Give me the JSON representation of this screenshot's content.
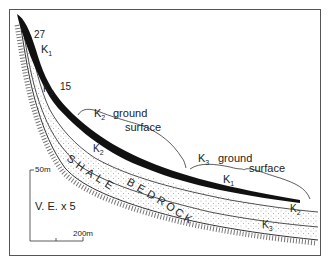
{
  "diagram": {
    "labels": {
      "k1_top": "K",
      "k1_top_sub": "1",
      "k3_left": "K",
      "k3_left_sub": "3",
      "slope_27": "27",
      "slope_15": "15",
      "k2_ground": "K",
      "k2_ground_sub": "2",
      "k2_ground_text": "ground",
      "k2_surface_text": "surface",
      "k3_ground": "K",
      "k3_ground_sub": "3",
      "k3_ground_text": "ground",
      "k3_surface_text": "surface",
      "k1_mid": "K",
      "k1_mid_sub": "1",
      "k2_mid": "K",
      "k2_mid_sub": "2",
      "k2_right": "K",
      "k2_right_sub": "2",
      "k3_right": "K",
      "k3_right_sub": "3",
      "bedrock": [
        "S",
        "H",
        "A",
        "L",
        "E",
        "B",
        "E",
        "D",
        "R",
        "O",
        "C",
        "K"
      ]
    },
    "scale": {
      "vertical": "50m",
      "horizontal": "200m",
      "exaggeration": "V. E. x 5"
    },
    "colors": {
      "frame": "#555555",
      "ink": "#111111",
      "hatch": "#666666",
      "stipple": "#999999"
    }
  }
}
